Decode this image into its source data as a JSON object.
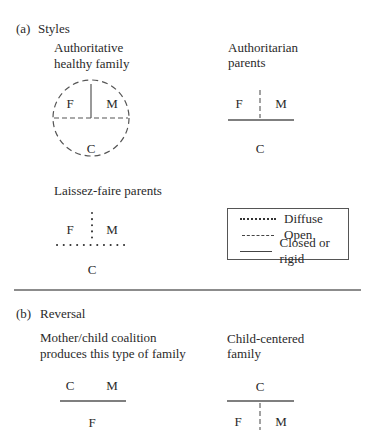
{
  "section_a": {
    "marker": "(a)",
    "title": "Styles",
    "authoritative": {
      "title_line1": "Authoritative",
      "title_line2": "healthy family",
      "f": "F",
      "m": "M",
      "c": "C"
    },
    "authoritarian": {
      "title_line1": "Authoritarian",
      "title_line2": "parents",
      "f": "F",
      "m": "M",
      "c": "C"
    },
    "laissez_faire": {
      "title": "Laissez-faire parents",
      "f": "F",
      "m": "M",
      "c": "C"
    },
    "legend": {
      "items": [
        {
          "style": "dotted",
          "label": "Diffuse"
        },
        {
          "style": "dashed",
          "label": "Open"
        },
        {
          "style": "solid",
          "label": "Closed or rigid"
        }
      ]
    }
  },
  "section_b": {
    "marker": "(b)",
    "title": "Reversal",
    "coalition": {
      "title_line1": "Mother/child coalition",
      "title_line2": "produces this type of family",
      "c": "C",
      "m": "M",
      "f": "F"
    },
    "child_centered": {
      "title_line1": "Child-centered",
      "title_line2": "family",
      "c": "C",
      "f": "F",
      "m": "M"
    }
  },
  "colors": {
    "line": "#555555",
    "text": "#2a2a2a"
  }
}
